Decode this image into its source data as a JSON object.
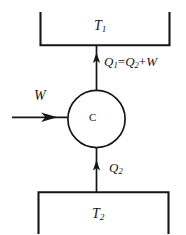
{
  "figure": {
    "name": "heat-engine-cycle-diagram",
    "type": "thermodynamic-cycle-schematic",
    "background_color": "#ffffff",
    "ink_color": "#161616",
    "width": 186,
    "height": 235
  },
  "reservoirs": {
    "hot": {
      "label": "T",
      "subscript": "1",
      "shape": "u-bracket-open-top",
      "position": "top"
    },
    "cold": {
      "label": "T",
      "subscript": "2",
      "shape": "u-bracket-open-bottom",
      "position": "bottom"
    }
  },
  "machine": {
    "label": "C",
    "shape": "circle"
  },
  "flows": {
    "heat_out": {
      "symbol": "Q",
      "subscript": "1",
      "equation_operator_eq": "=",
      "equation_term_symbol": "Q",
      "equation_term_subscript": "2",
      "equation_operator_plus": "+",
      "equation_work_symbol": "W",
      "direction": "up",
      "full_text": "Q1 = Q2 + W"
    },
    "heat_in": {
      "symbol": "Q",
      "subscript": "2",
      "direction": "up"
    },
    "work_in": {
      "symbol": "W",
      "direction": "right"
    }
  }
}
